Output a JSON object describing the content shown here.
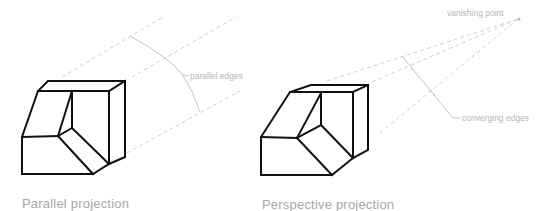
{
  "figure": {
    "left_panel": {
      "caption": "Parallel projection",
      "annotation": "parallel edges"
    },
    "right_panel": {
      "caption": "Perspective projection",
      "annotation_top": "vanishing point",
      "annotation_side": "converging edges"
    }
  },
  "colors": {
    "edge": "#111111",
    "dashed_guide": "#cfcfcf",
    "leader": "#c4c4c4",
    "annotation_text": "#b5b5b5",
    "caption_text": "#a8a8a8"
  }
}
